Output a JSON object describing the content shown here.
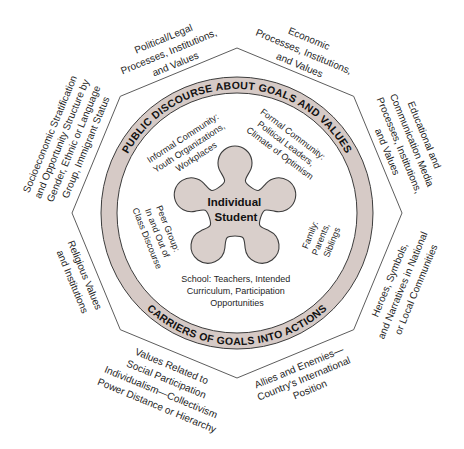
{
  "colors": {
    "ring_fill": "#d6cac6",
    "blob_fill": "#d9cfcb",
    "outline": "#3c3c3c",
    "text": "#1e1e1e"
  },
  "diagram": {
    "ring": {
      "top_label": "PUBLIC DISCOURSE ABOUT GOALS AND VALUES",
      "bottom_label": "CARRIERS OF GOALS INTO ACTIONS"
    },
    "center": {
      "lines": [
        "Individual",
        "Student"
      ]
    },
    "inner_labels": {
      "informal_community": [
        "Informal Community:",
        "Youth Organizations,",
        "Workplaces"
      ],
      "formal_community": [
        "Formal Community:",
        "Political Leaders,",
        "Climate of Optimism"
      ],
      "peer_group": [
        "Peer Group:",
        "In and Out of",
        "Class Discourse"
      ],
      "family": [
        "Family:",
        "Parents,",
        "Siblings"
      ],
      "school": [
        "School: Teachers, Intended",
        "Curriculum, Participation",
        "Opportunities"
      ]
    },
    "outer_labels": {
      "political_legal": [
        "Political/Legal",
        "Processes, Institutions,",
        "and Values"
      ],
      "economic": [
        "Economic",
        "Processes, Institutions,",
        "and Values"
      ],
      "educational_media": [
        "Educational and",
        "Communication Media",
        "Processes, Institutions,",
        "and Values"
      ],
      "heroes_symbols": [
        "Heroes, Symbols,",
        "and Narratives in National",
        "or Local Communities"
      ],
      "allies_enemies": [
        "Allies and Enemies—",
        "Country's International",
        "Position"
      ],
      "social_participation": [
        "Values Related to",
        "Social Participation",
        "Individualism—Collectivism",
        "Power Distance or Hierarchy"
      ],
      "religious": [
        "Religious Values",
        "and Institutions"
      ],
      "socioeconomic": [
        "Socioeconomic Stratification",
        "and Opportunity Structure by",
        "Gender, Ethnic or Language",
        "Group, Immigrant Status"
      ]
    }
  }
}
